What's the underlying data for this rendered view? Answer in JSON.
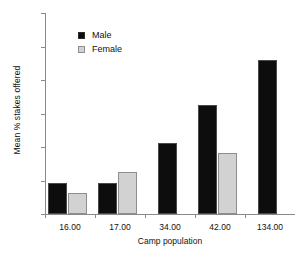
{
  "chart_data": {
    "type": "bar",
    "title": "",
    "xlabel": "Camp population",
    "ylabel": "Mean % stakes offered",
    "categories": [
      "16.00",
      "17.00",
      "34.00",
      "42.00",
      "134.00"
    ],
    "series": [
      {
        "name": "Male",
        "color": "#0d0d0d",
        "values": [
          9.2,
          9.2,
          21.2,
          32.5,
          46.0
        ]
      },
      {
        "name": "Female",
        "color": "#d2d2d2",
        "values": [
          6.2,
          12.5,
          null,
          18.2,
          null
        ]
      }
    ],
    "ylim": [
      0,
      60
    ],
    "yticks": [
      0,
      10,
      20,
      30,
      40,
      50,
      60
    ],
    "ytick_labels": [
      "0",
      "10",
      "20",
      "30",
      "40",
      "50",
      "60"
    ],
    "grid": false,
    "legend_position": "upper left",
    "legend_entries": [
      "Male",
      "Female"
    ]
  }
}
